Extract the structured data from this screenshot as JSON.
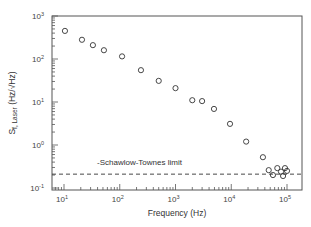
{
  "chart_data": {
    "type": "scatter",
    "title": "",
    "xlabel": "Frequency (Hz)",
    "ylabel": "S_f, Laser (Hz/√Hz)",
    "ylabel_parts": {
      "main": "S",
      "sub": "f, Laser",
      "units": "(Hz/√Hz)"
    },
    "xscale": "log",
    "yscale": "log",
    "xlim": [
      5,
      200000
    ],
    "ylim": [
      0.1,
      1000
    ],
    "x_ticks": [
      {
        "value": 10,
        "base": "10",
        "exp": "1"
      },
      {
        "value": 100,
        "base": "10",
        "exp": "2"
      },
      {
        "value": 1000,
        "base": "10",
        "exp": "3"
      },
      {
        "value": 10000,
        "base": "10",
        "exp": "4"
      },
      {
        "value": 100000,
        "base": "10",
        "exp": "5"
      }
    ],
    "y_ticks": [
      {
        "value": 0.1,
        "base": "10",
        "exp": "-1"
      },
      {
        "value": 1,
        "base": "10",
        "exp": "0"
      },
      {
        "value": 10,
        "base": "10",
        "exp": "1"
      },
      {
        "value": 100,
        "base": "10",
        "exp": "2"
      },
      {
        "value": 1000,
        "base": "10",
        "exp": "3"
      }
    ],
    "grid": false,
    "legend": null,
    "series": [
      {
        "name": "Measured laser frequency noise",
        "marker": "open-circle",
        "x": [
          10.4,
          21,
          33,
          52,
          110,
          240,
          500,
          1000,
          2000,
          3000,
          4900,
          9500,
          18500,
          37000,
          47000,
          56000,
          67000,
          78000,
          85000,
          92000,
          100000
        ],
        "y": [
          450,
          280,
          210,
          160,
          115,
          55,
          31,
          21,
          11,
          10.5,
          6.9,
          3.1,
          1.2,
          0.52,
          0.26,
          0.2,
          0.29,
          0.24,
          0.19,
          0.29,
          0.25
        ]
      }
    ],
    "reference_lines": [
      {
        "type": "horizontal",
        "value": 0.21,
        "style": "dashed",
        "label": "-Schawlow-Townes limit"
      }
    ],
    "annotations": [
      {
        "text": "-Schawlow-Townes limit",
        "x": 600,
        "y": 0.32
      }
    ]
  }
}
